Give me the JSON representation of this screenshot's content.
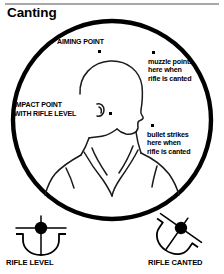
{
  "page": {
    "title": "Canting",
    "background_color": "#ffffff",
    "ink_color": "#000000",
    "rule_color": "#a8a8a8"
  },
  "diagram": {
    "name": "canting-sight-picture-diagram",
    "labels": {
      "aiming_point": "AIMING POINT",
      "impact_point_line1": "IMPACT POINT",
      "impact_point_line2": "WITH RIFLE LEVEL",
      "muzzle_line1": "muzzle points",
      "muzzle_line2": "here when",
      "muzzle_line3": "rifle is canted",
      "bullet_line1": "bullet strikes",
      "bullet_line2": "here when",
      "bullet_line3": "rifle is canted"
    },
    "markers": [
      {
        "name": "aiming-point-dot",
        "label": "AIMING POINT",
        "x": 99,
        "y": 51
      },
      {
        "name": "muzzle-point-dot",
        "label": "muzzle points here when rifle is canted",
        "x": 153,
        "y": 52
      },
      {
        "name": "impact-point-dot",
        "label": "IMPACT POINT WITH RIFLE LEVEL",
        "x": 110,
        "y": 113
      },
      {
        "name": "bullet-strike-dot",
        "label": "bullet strikes here when rifle is canted",
        "x": 152,
        "y": 125
      }
    ],
    "target_figure": "head-and-shoulders-silhouette",
    "circle": {
      "cx": 112,
      "cy": 120,
      "r": 100
    }
  },
  "footer": {
    "rifle_level_label": "RIFLE LEVEL",
    "rifle_canted_label": "RIFLE CANTED",
    "rifle_level_icon": "front-sight-bead-level-icon",
    "rifle_canted_icon": "front-sight-bead-canted-icon",
    "cant_angle_degrees": 35
  }
}
